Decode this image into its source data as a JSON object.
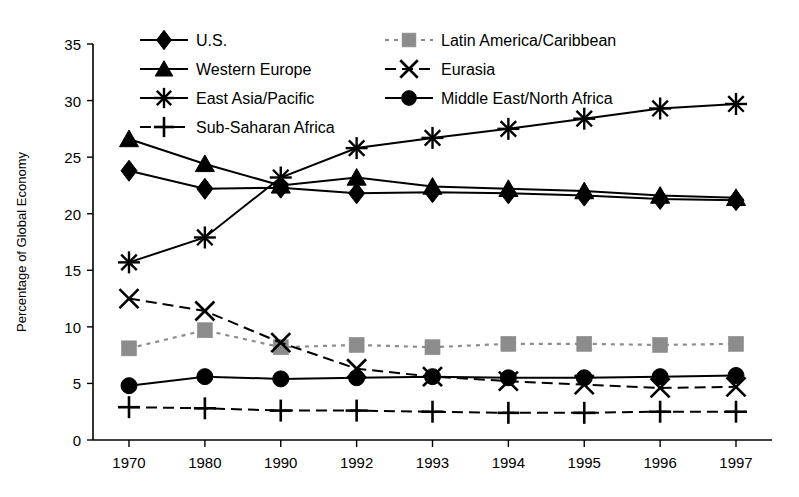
{
  "chart_data": {
    "type": "line",
    "title": "",
    "xlabel": "",
    "ylabel": "Percentage of Global Economy",
    "categories": [
      "1970",
      "1980",
      "1990",
      "1992",
      "1993",
      "1994",
      "1995",
      "1996",
      "1997"
    ],
    "ylim": [
      0,
      35
    ],
    "yticks": [
      "0",
      "5",
      "10",
      "15",
      "20",
      "25",
      "30",
      "35"
    ],
    "grid": false,
    "legend_position": "top-inside",
    "series": [
      {
        "name": "U.S.",
        "marker": "diamond",
        "line_style": "solid",
        "color": "#000000",
        "values": [
          23.8,
          22.2,
          22.3,
          21.8,
          21.9,
          21.8,
          21.6,
          21.3,
          21.2
        ]
      },
      {
        "name": "Western Europe",
        "marker": "triangle",
        "line_style": "solid",
        "color": "#000000",
        "values": [
          26.6,
          24.4,
          22.5,
          23.2,
          22.4,
          22.2,
          22.0,
          21.6,
          21.4
        ]
      },
      {
        "name": "East Asia/Pacific",
        "marker": "asterisk",
        "line_style": "solid",
        "color": "#000000",
        "values": [
          15.7,
          17.9,
          23.2,
          25.8,
          26.7,
          27.5,
          28.4,
          29.3,
          29.7
        ]
      },
      {
        "name": "Sub-Saharan Africa",
        "marker": "plus",
        "line_style": "dashed",
        "color": "#000000",
        "values": [
          2.9,
          2.8,
          2.6,
          2.6,
          2.5,
          2.4,
          2.4,
          2.5,
          2.5
        ]
      },
      {
        "name": "Latin America/Caribbean",
        "marker": "square",
        "line_style": "dotted",
        "color": "#8c8c8c",
        "values": [
          8.1,
          9.7,
          8.2,
          8.4,
          8.2,
          8.5,
          8.5,
          8.4,
          8.5
        ]
      },
      {
        "name": "Eurasia",
        "marker": "x",
        "line_style": "dashed",
        "color": "#000000",
        "values": [
          12.5,
          11.4,
          8.6,
          6.3,
          5.6,
          5.2,
          4.9,
          4.6,
          4.7
        ]
      },
      {
        "name": "Middle East/North Africa",
        "marker": "circle",
        "line_style": "solid",
        "color": "#000000",
        "values": [
          4.8,
          5.6,
          5.4,
          5.5,
          5.6,
          5.5,
          5.5,
          5.6,
          5.7
        ]
      }
    ]
  },
  "legend": {
    "column1": [
      {
        "label": "U.S.",
        "marker": "diamond"
      },
      {
        "label": "Western Europe",
        "marker": "triangle"
      },
      {
        "label": "East Asia/Pacific",
        "marker": "asterisk"
      },
      {
        "label": "Sub-Saharan Africa",
        "marker": "plus"
      }
    ],
    "column2": [
      {
        "label": "Latin America/Caribbean",
        "marker": "square"
      },
      {
        "label": "Eurasia",
        "marker": "x"
      },
      {
        "label": "Middle East/North Africa",
        "marker": "circle"
      }
    ]
  }
}
